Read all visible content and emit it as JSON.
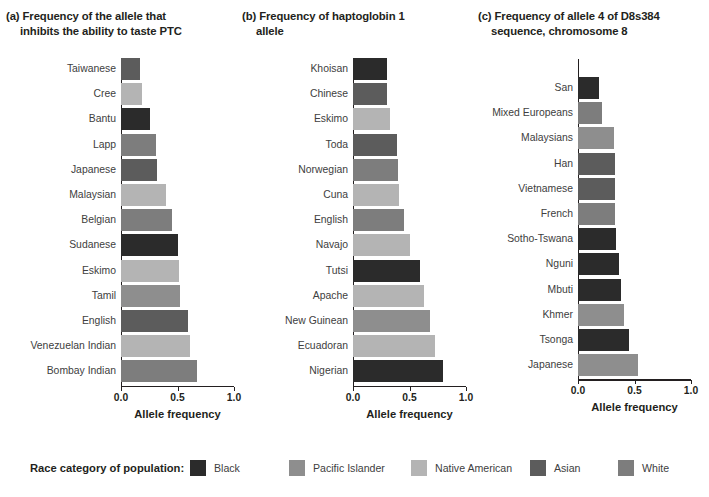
{
  "figure": {
    "width": 709,
    "height": 497,
    "axis_title": "Allele frequency",
    "tick_labels": [
      "0.0",
      "0.5",
      "1.0"
    ],
    "tick_values": [
      0.0,
      0.5,
      1.0
    ]
  },
  "legend": {
    "title": "Race category of population:",
    "items": [
      {
        "label": "Black",
        "color": "#2b2b2b"
      },
      {
        "label": "Pacific Islander",
        "color": "#8e8e8e"
      },
      {
        "label": "Native American",
        "color": "#b4b4b4"
      },
      {
        "label": "Asian",
        "color": "#5c5c5c"
      },
      {
        "label": "White",
        "color": "#7d7d7d"
      }
    ]
  },
  "chart_data": [
    {
      "type": "bar",
      "orientation": "horizontal",
      "panel": "(a)",
      "title": "(a) Frequency of the allele that inhibits the ability to taste PTC",
      "title_line1": "(a) Frequency of the allele that",
      "title_line2": "inhibits the ability to taste PTC",
      "xlabel": "Allele frequency",
      "ylabel": "",
      "xlim": [
        0.0,
        1.0
      ],
      "xticks": [
        0.0,
        0.5,
        1.0
      ],
      "grid": false,
      "categories": [
        "Taiwanese",
        "Cree",
        "Bantu",
        "Lapp",
        "Japanese",
        "Malaysian",
        "Belgian",
        "Sudanese",
        "Eskimo",
        "Tamil",
        "English",
        "Venezuelan Indian",
        "Bombay Indian"
      ],
      "values": [
        0.17,
        0.19,
        0.26,
        0.31,
        0.32,
        0.4,
        0.45,
        0.5,
        0.51,
        0.52,
        0.59,
        0.61,
        0.67
      ],
      "race_categories": [
        "Asian",
        "Native American",
        "Black",
        "White",
        "Asian",
        "Native American",
        "White",
        "Black",
        "Native American",
        "Pacific Islander",
        "Asian",
        "Native American",
        "White"
      ],
      "colors": [
        "#5c5c5c",
        "#b4b4b4",
        "#2b2b2b",
        "#7d7d7d",
        "#5c5c5c",
        "#b4b4b4",
        "#7d7d7d",
        "#2b2b2b",
        "#b4b4b4",
        "#8e8e8e",
        "#5c5c5c",
        "#b4b4b4",
        "#7d7d7d"
      ]
    },
    {
      "type": "bar",
      "orientation": "horizontal",
      "panel": "(b)",
      "title": "(b) Frequency of haptoglobin 1 allele",
      "title_line1": "(b) Frequency of haptoglobin 1",
      "title_line2": "allele",
      "xlabel": "Allele frequency",
      "ylabel": "",
      "xlim": [
        0.0,
        1.0
      ],
      "xticks": [
        0.0,
        0.5,
        1.0
      ],
      "grid": false,
      "categories": [
        "Khoisan",
        "Chinese",
        "Eskimo",
        "Toda",
        "Norwegian",
        "Cuna",
        "English",
        "Navajo",
        "Tutsi",
        "Apache",
        "New Guinean",
        "Ecuadoran",
        "Nigerian"
      ],
      "values": [
        0.3,
        0.3,
        0.33,
        0.39,
        0.4,
        0.41,
        0.45,
        0.5,
        0.59,
        0.63,
        0.68,
        0.73,
        0.8
      ],
      "race_categories": [
        "Black",
        "Asian",
        "Native American",
        "Asian",
        "White",
        "Native American",
        "White",
        "Native American",
        "Black",
        "Native American",
        "Pacific Islander",
        "Native American",
        "Black"
      ],
      "colors": [
        "#2b2b2b",
        "#5c5c5c",
        "#b4b4b4",
        "#5c5c5c",
        "#7d7d7d",
        "#b4b4b4",
        "#7d7d7d",
        "#b4b4b4",
        "#2b2b2b",
        "#b4b4b4",
        "#8e8e8e",
        "#b4b4b4",
        "#2b2b2b"
      ]
    },
    {
      "type": "bar",
      "orientation": "horizontal",
      "panel": "(c)",
      "title": "(c) Frequency of allele 4 of D8s384 sequence, chromosome 8",
      "title_line1": "(c) Frequency of allele 4 of D8s384",
      "title_line2": "sequence, chromosome 8",
      "xlabel": "Allele frequency",
      "ylabel": "",
      "xlim": [
        0.0,
        1.0
      ],
      "xticks": [
        0.0,
        0.5,
        1.0
      ],
      "grid": false,
      "categories": [
        "San",
        "Mixed Europeans",
        "Malaysians",
        "Han",
        "Vietnamese",
        "French",
        "Sotho-Tswana",
        "Nguni",
        "Mbuti",
        "Khmer",
        "Tsonga",
        "Japanese"
      ],
      "values": [
        0.19,
        0.21,
        0.32,
        0.33,
        0.33,
        0.33,
        0.34,
        0.36,
        0.38,
        0.41,
        0.45,
        0.53
      ],
      "race_categories": [
        "Black",
        "White",
        "Pacific Islander",
        "Asian",
        "Asian",
        "White",
        "Black",
        "Black",
        "Black",
        "Pacific Islander",
        "Black",
        "Pacific Islander"
      ],
      "colors": [
        "#2b2b2b",
        "#7d7d7d",
        "#8e8e8e",
        "#5c5c5c",
        "#5c5c5c",
        "#7d7d7d",
        "#2b2b2b",
        "#2b2b2b",
        "#2b2b2b",
        "#8e8e8e",
        "#2b2b2b",
        "#8e8e8e"
      ]
    }
  ]
}
